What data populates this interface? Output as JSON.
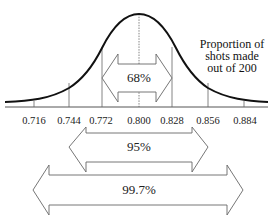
{
  "diagram": {
    "type": "normal-distribution",
    "annotation": [
      "Proportion of",
      "shots made",
      "out of 200"
    ],
    "mean": 0.8,
    "std_dev": 0.028,
    "tick_labels": [
      "0.716",
      "0.744",
      "0.772",
      "0.800",
      "0.828",
      "0.856",
      "0.884"
    ],
    "intervals": [
      {
        "label": "68%",
        "from": "0.772",
        "to": "0.828"
      },
      {
        "label": "95%",
        "from": "0.744",
        "to": "0.856"
      },
      {
        "label": "99.7%",
        "from": "0.716",
        "to": "0.884"
      }
    ]
  }
}
